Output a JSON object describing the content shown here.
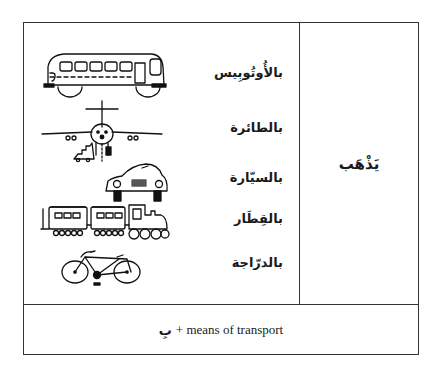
{
  "table": {
    "verb": "يَذْهَب",
    "transport_rows": [
      {
        "label": "بالأُوتُوبِيس",
        "icon": "bus-icon"
      },
      {
        "label": "بالطائرة",
        "icon": "airplane-icon"
      },
      {
        "label": "بالسيّارة",
        "icon": "car-icon"
      },
      {
        "label": "بالقِطَار",
        "icon": "train-icon"
      },
      {
        "label": "بالدرّاجة",
        "icon": "bicycle-icon"
      }
    ],
    "footer": {
      "arabic": "بِ",
      "text": "+ means of transport"
    }
  }
}
